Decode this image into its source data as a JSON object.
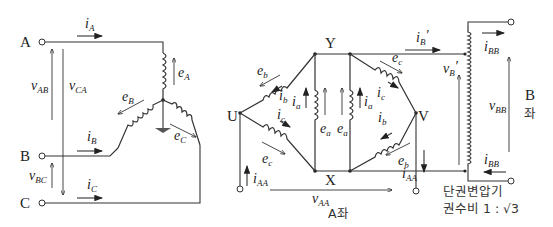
{
  "diagram": {
    "type": "transformer-connection-schematic",
    "left_section": {
      "terminals": [
        "A",
        "B",
        "C"
      ],
      "currents": [
        {
          "base": "i",
          "sub": "A"
        },
        {
          "base": "i",
          "sub": "B"
        },
        {
          "base": "i",
          "sub": "C"
        }
      ],
      "line_voltages": [
        {
          "base": "v",
          "sub": "AB"
        },
        {
          "base": "v",
          "sub": "CA"
        },
        {
          "base": "v",
          "sub": "BC"
        }
      ],
      "phase_emfs": [
        {
          "base": "e",
          "sub": "A"
        },
        {
          "base": "e",
          "sub": "B"
        },
        {
          "base": "e",
          "sub": "C"
        }
      ]
    },
    "middle_section": {
      "nodes": {
        "U": "U",
        "V": "V",
        "X": "X",
        "Y": "Y"
      },
      "emfs": {
        "eb_left": {
          "base": "e",
          "sub": "b"
        },
        "ec_left": {
          "base": "e",
          "sub": "c"
        },
        "ea_left": {
          "base": "e",
          "sub": "a"
        },
        "ea_right": {
          "base": "e",
          "sub": "a"
        },
        "ec_right": {
          "base": "e",
          "sub": "c"
        },
        "eb_right": {
          "base": "e",
          "sub": "b"
        }
      },
      "currents": {
        "ib_left": {
          "base": "i",
          "sub": "b"
        },
        "ic_left": {
          "base": "i",
          "sub": "c"
        },
        "ia_left": {
          "base": "i",
          "sub": "a"
        },
        "ia_right": {
          "base": "i",
          "sub": "a"
        },
        "ic_right": {
          "base": "i",
          "sub": "c"
        },
        "ib_right": {
          "base": "i",
          "sub": "b"
        },
        "iAA_left": {
          "base": "i",
          "sub": "AA"
        },
        "iAA_right": {
          "base": "i",
          "sub": "AA"
        },
        "iB_prime": {
          "base": "i",
          "sub": "B",
          "prime": "′"
        }
      },
      "voltage_AA": {
        "base": "v",
        "sub": "AA"
      },
      "seat_label": "A좌"
    },
    "right_section": {
      "currents": {
        "iBB_top": {
          "base": "i",
          "sub": "BB"
        },
        "iBB_bottom": {
          "base": "i",
          "sub": "BB"
        }
      },
      "voltages": {
        "vB_prime": {
          "base": "v",
          "sub": "B",
          "prime": "′"
        },
        "vBB": {
          "base": "v",
          "sub": "BB"
        }
      },
      "seat_label_line1": "B",
      "seat_label_line2": "좌",
      "caption_line1": "단권변압기",
      "caption_line2_prefix": "권수비 1 : ",
      "caption_line2_sqrt": "√3"
    }
  }
}
